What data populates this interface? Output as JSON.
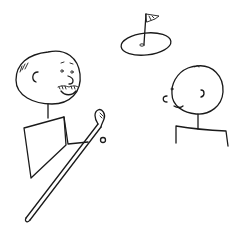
{
  "scene": {
    "description": "Hand-drawn line sketch of two stick figures near a golf green",
    "colors": {
      "background": "#ffffff",
      "ink": "#1a1a1a"
    },
    "elements": [
      {
        "id": "golfer-left",
        "label": "Smiling stick figure with mustache holding a golf club"
      },
      {
        "id": "person-right",
        "label": "Stick figure with round head facing left"
      },
      {
        "id": "golf-green",
        "label": "Oval putting green with hole"
      },
      {
        "id": "flag",
        "label": "Flag on a pin"
      },
      {
        "id": "golf-club",
        "label": "Long golf club held diagonally"
      }
    ]
  }
}
